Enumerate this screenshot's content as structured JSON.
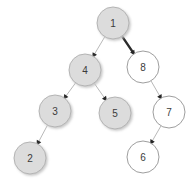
{
  "diagram": {
    "kind": "binary-tree",
    "canvas": {
      "width": 195,
      "height": 185,
      "background": "#ffffff"
    },
    "style": {
      "node_radius": 16,
      "filled_fill": "#dcdcdc",
      "filled_stroke": "#b4b4b4",
      "empty_fill": "#ffffff",
      "empty_stroke": "#9e9e9e",
      "label_color": "#3b3b3b",
      "edge_normal_color": "#b9b9b9",
      "edge_normal_width": 1,
      "edge_highlight_color": "#2b2b2b",
      "edge_highlight_width": 2.4,
      "arrowhead_color": "#262626",
      "shadow_color": "#c9c9c9"
    },
    "nodes": [
      {
        "id": "n1",
        "label": "1",
        "cx": 113,
        "cy": 23,
        "r": 16,
        "filled": true,
        "shadow": true
      },
      {
        "id": "n4",
        "label": "4",
        "cx": 85,
        "cy": 70,
        "r": 16,
        "filled": true,
        "shadow": true
      },
      {
        "id": "n8",
        "label": "8",
        "cx": 143,
        "cy": 67,
        "r": 16,
        "filled": false,
        "shadow": false
      },
      {
        "id": "n3",
        "label": "3",
        "cx": 55,
        "cy": 111,
        "r": 16,
        "filled": true,
        "shadow": true
      },
      {
        "id": "n5",
        "label": "5",
        "cx": 115,
        "cy": 113,
        "r": 16,
        "filled": true,
        "shadow": true
      },
      {
        "id": "n7",
        "label": "7",
        "cx": 169,
        "cy": 112,
        "r": 16,
        "filled": false,
        "shadow": false
      },
      {
        "id": "n2",
        "label": "2",
        "cx": 30,
        "cy": 158,
        "r": 16,
        "filled": true,
        "shadow": true
      },
      {
        "id": "n6",
        "label": "6",
        "cx": 143,
        "cy": 157,
        "r": 16,
        "filled": false,
        "shadow": false
      }
    ],
    "edges": [
      {
        "id": "e1-4",
        "from": "n1",
        "to": "n4",
        "side": "left",
        "highlight": false,
        "arrow": true
      },
      {
        "id": "e1-8",
        "from": "n1",
        "to": "n8",
        "side": "right",
        "highlight": true,
        "arrow": true
      },
      {
        "id": "e4-3",
        "from": "n4",
        "to": "n3",
        "side": "left",
        "highlight": false,
        "arrow": true
      },
      {
        "id": "e4-5",
        "from": "n4",
        "to": "n5",
        "side": "right",
        "highlight": false,
        "arrow": true
      },
      {
        "id": "e3-2",
        "from": "n3",
        "to": "n2",
        "side": "left",
        "highlight": false,
        "arrow": true
      },
      {
        "id": "e8-7",
        "from": "n8",
        "to": "n7",
        "side": "right",
        "highlight": false,
        "arrow": true
      },
      {
        "id": "e7-6",
        "from": "n7",
        "to": "n6",
        "side": "left",
        "highlight": false,
        "arrow": true
      }
    ]
  }
}
